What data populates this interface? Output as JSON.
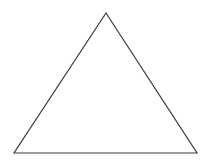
{
  "diagram": {
    "shape": "triangle",
    "vertices": [
      {
        "x": 106,
        "y": 13
      },
      {
        "x": 14,
        "y": 153
      },
      {
        "x": 197,
        "y": 153
      }
    ],
    "stroke_color": "#3a3a3a",
    "fill_color": "#ffffff",
    "background_color": "#ffffff"
  }
}
